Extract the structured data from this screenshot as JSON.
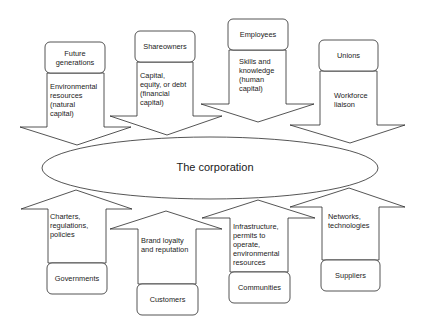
{
  "diagram": {
    "center": {
      "label": "The corporation"
    },
    "inputs": [
      {
        "stakeholder": "Future generations",
        "contribution": "Environmental\nresources\n(natural\ncapital)",
        "direction": "in"
      },
      {
        "stakeholder": "Shareowners",
        "contribution": "Capital,\nequity, or debt\n(financial\ncapital)",
        "direction": "in"
      },
      {
        "stakeholder": "Employees",
        "contribution": "Skills and\nknowledge\n(human\ncapital)",
        "direction": "in"
      },
      {
        "stakeholder": "Unions",
        "contribution": "Workforce\nliaison",
        "direction": "in"
      }
    ],
    "outputs": [
      {
        "stakeholder": "Governments",
        "contribution": "Charters,\nregulations,\npolicies",
        "direction": "out"
      },
      {
        "stakeholder": "Customers",
        "contribution": "Brand loyalty\nand reputation",
        "direction": "out"
      },
      {
        "stakeholder": "Communities",
        "contribution": "Infrastructure,\npermits to\noperate,\nenvironmental\nresources",
        "direction": "out"
      },
      {
        "stakeholder": "Suppliers",
        "contribution": "Networks,\ntechnologies",
        "direction": "out"
      }
    ],
    "colors": {
      "stroke": "#2a2a2a",
      "fill": "#ffffff",
      "text": "#222222"
    }
  }
}
